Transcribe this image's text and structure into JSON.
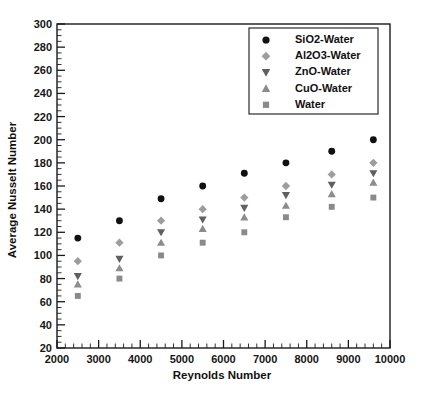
{
  "chart_data": {
    "type": "scatter",
    "title": "",
    "xlabel": "Reynolds Number",
    "ylabel": "Average Nusselt Number",
    "xlim": [
      2000,
      10000
    ],
    "ylim": [
      20,
      300
    ],
    "xticks": [
      2000,
      3000,
      4000,
      5000,
      6000,
      7000,
      8000,
      9000,
      10000
    ],
    "yticks": [
      20,
      40,
      60,
      80,
      100,
      120,
      140,
      160,
      180,
      200,
      220,
      240,
      260,
      280,
      300
    ],
    "x_minor_step": 200,
    "y_minor_step": 5,
    "grid": false,
    "legend_position": "top-right",
    "x": [
      2500,
      3500,
      4500,
      5500,
      6500,
      7500,
      8600,
      9600
    ],
    "series": [
      {
        "name": "SiO2-Water",
        "marker": "circle",
        "color": "#111111",
        "values": [
          115,
          130,
          149,
          160,
          171,
          180,
          190,
          200
        ]
      },
      {
        "name": "Al2O3-Water",
        "marker": "diamond",
        "color": "#9d9d9d",
        "values": [
          95,
          111,
          130,
          140,
          150,
          160,
          170,
          180
        ]
      },
      {
        "name": "ZnO-Water",
        "marker": "triangle-down",
        "color": "#5f5f5f",
        "values": [
          82,
          97,
          120,
          131,
          141,
          152,
          161,
          171
        ]
      },
      {
        "name": "CuO-Water",
        "marker": "triangle-up",
        "color": "#8c8c8c",
        "values": [
          75,
          89,
          111,
          123,
          133,
          143,
          153,
          163
        ]
      },
      {
        "name": "Water",
        "marker": "square",
        "color": "#8a8a8a",
        "values": [
          65,
          80,
          100,
          111,
          120,
          133,
          142,
          150
        ]
      }
    ]
  },
  "legend": {
    "entries": [
      {
        "label": "SiO2-Water"
      },
      {
        "label": "Al2O3-Water"
      },
      {
        "label": "ZnO-Water"
      },
      {
        "label": "CuO-Water"
      },
      {
        "label": "Water"
      }
    ]
  },
  "axes": {
    "x_title": "Reynolds Number",
    "y_title": "Average Nusselt Number"
  }
}
